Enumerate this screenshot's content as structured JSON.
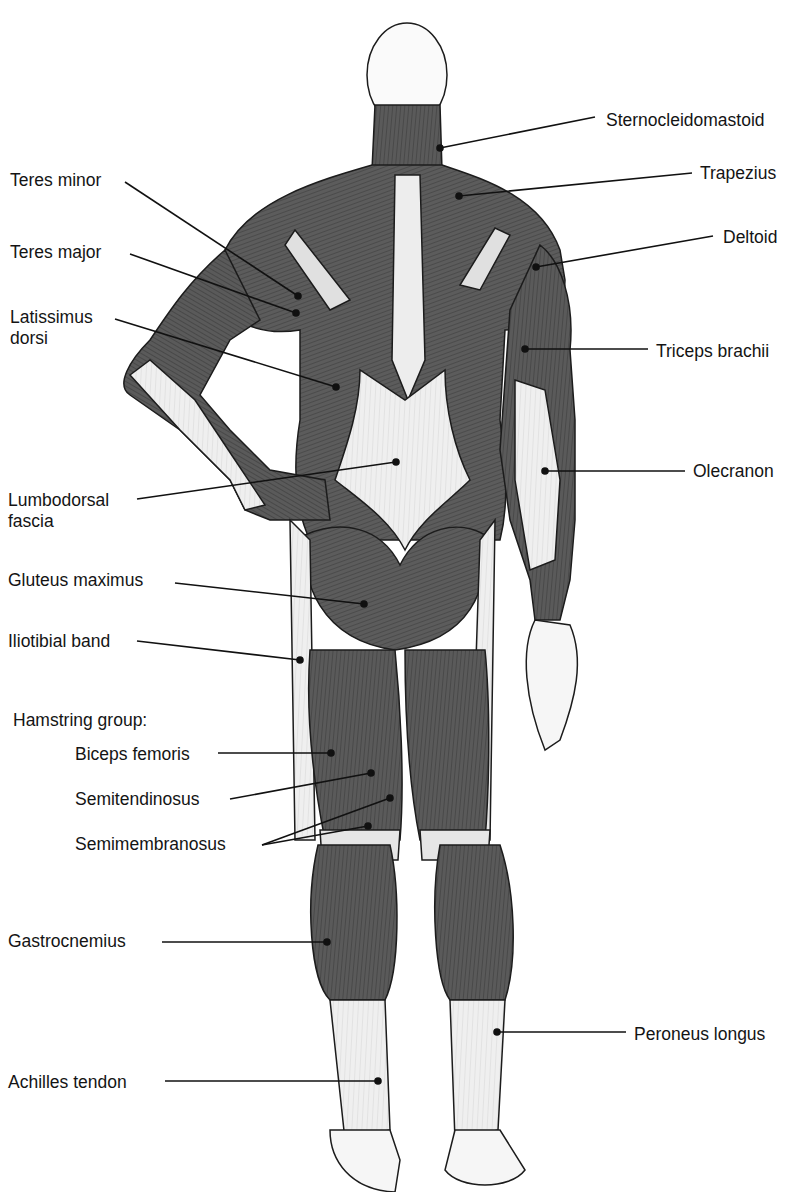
{
  "figure": {
    "colors": {
      "muscle": "#5a5a5a",
      "muscle_dark": "#3e3e3e",
      "tendon": "#e9e9e9",
      "skin": "#f4f4f4",
      "outline": "#1c1c1c",
      "line": "#111111"
    }
  },
  "labels": {
    "left": [
      {
        "id": "teres-minor",
        "text": "Teres minor",
        "x": 10,
        "y": 170,
        "anchor": [
          298,
          296
        ]
      },
      {
        "id": "teres-major",
        "text": "Teres major",
        "x": 10,
        "y": 242,
        "anchor": [
          296,
          313
        ]
      },
      {
        "id": "latissimus",
        "text": "Latissimus\ndorsi",
        "x": 10,
        "y": 307,
        "anchor": [
          336,
          387
        ]
      },
      {
        "id": "lumbodorsal",
        "text": "Lumbodorsal\nfascia",
        "x": 8,
        "y": 490,
        "anchor": [
          396,
          462
        ]
      },
      {
        "id": "gluteus-maximus",
        "text": "Gluteus maximus",
        "x": 8,
        "y": 570,
        "anchor": [
          364,
          604
        ]
      },
      {
        "id": "iliotibial",
        "text": "Iliotibial band",
        "x": 8,
        "y": 631,
        "anchor": [
          300,
          660
        ]
      },
      {
        "id": "hamstring-group",
        "text": "Hamstring group:",
        "x": 13,
        "y": 710,
        "anchor": null
      },
      {
        "id": "biceps-femoris",
        "text": "Biceps femoris",
        "x": 75,
        "y": 744,
        "anchor": [
          331,
          753
        ]
      },
      {
        "id": "semitendinosus",
        "text": "Semitendinosus",
        "x": 75,
        "y": 789,
        "anchor": [
          371,
          773
        ]
      },
      {
        "id": "semimembranosus",
        "text": "Semimembranosus",
        "x": 75,
        "y": 834,
        "anchor": [
          390,
          798
        ],
        "anchor2": [
          368,
          826
        ]
      },
      {
        "id": "gastrocnemius",
        "text": "Gastrocnemius",
        "x": 8,
        "y": 931,
        "anchor": [
          327,
          942
        ]
      },
      {
        "id": "achilles",
        "text": "Achilles tendon",
        "x": 8,
        "y": 1072,
        "anchor": [
          378,
          1081
        ]
      }
    ],
    "right": [
      {
        "id": "sternocleidomastoid",
        "text": "Sternocleidomastoid",
        "x": 606,
        "y": 110,
        "anchor": [
          440,
          148
        ]
      },
      {
        "id": "trapezius",
        "text": "Trapezius",
        "x": 700,
        "y": 163,
        "anchor": [
          459,
          196
        ]
      },
      {
        "id": "deltoid",
        "text": "Deltoid",
        "x": 723,
        "y": 227,
        "anchor": [
          536,
          267
        ]
      },
      {
        "id": "triceps",
        "text": "Triceps brachii",
        "x": 656,
        "y": 341,
        "anchor": [
          525,
          349
        ]
      },
      {
        "id": "olecranon",
        "text": "Olecranon",
        "x": 693,
        "y": 461,
        "anchor": [
          545,
          471
        ]
      },
      {
        "id": "peroneus",
        "text": "Peroneus longus",
        "x": 634,
        "y": 1024,
        "anchor": [
          497,
          1032
        ]
      }
    ]
  }
}
